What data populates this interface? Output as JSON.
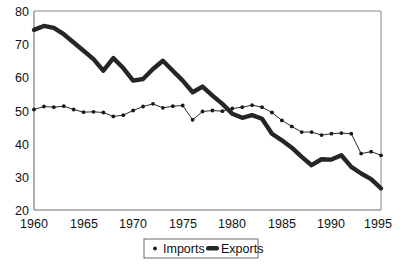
{
  "chart_data": {
    "type": "line",
    "title": "",
    "subtitle": "",
    "xlabel": "",
    "ylabel": "",
    "xlim": [
      1960,
      1995
    ],
    "ylim": [
      20,
      80
    ],
    "grid": false,
    "legend_position": "bottom-center",
    "x": [
      1960,
      1961,
      1962,
      1963,
      1964,
      1965,
      1966,
      1967,
      1968,
      1969,
      1970,
      1971,
      1972,
      1973,
      1974,
      1975,
      1976,
      1977,
      1978,
      1979,
      1980,
      1981,
      1982,
      1983,
      1984,
      1985,
      1986,
      1987,
      1988,
      1989,
      1990,
      1991,
      1992,
      1993,
      1994,
      1995
    ],
    "xticks": [
      1960,
      1965,
      1970,
      1975,
      1980,
      1985,
      1990,
      1995
    ],
    "xtick_labels": [
      "1960",
      "1965",
      "1970",
      "1975",
      "1980",
      "1985",
      "1990",
      "1995"
    ],
    "yticks": [
      20,
      30,
      40,
      50,
      60,
      70,
      80
    ],
    "ytick_labels": [
      "20",
      "30",
      "40",
      "50",
      "60",
      "70",
      "80"
    ],
    "series": [
      {
        "name": "Imports",
        "marker": "dot",
        "line_width": "thin",
        "values": [
          50.3,
          51.2,
          51.0,
          51.3,
          50.3,
          49.5,
          49.6,
          49.4,
          48.2,
          48.6,
          50.0,
          51.2,
          52.0,
          50.8,
          51.3,
          51.5,
          47.2,
          49.7,
          50.0,
          49.8,
          50.6,
          51.0,
          51.6,
          51.0,
          49.4,
          47.0,
          45.2,
          43.5,
          43.5,
          42.6,
          43.0,
          43.2,
          42.0,
          43.3,
          42.6,
          42.0
        ]
      },
      {
        "name": "Exports",
        "marker": "none",
        "line_width": "thick",
        "values": [
          74.3,
          75.5,
          74.9,
          73.0,
          70.5,
          68.0,
          65.5,
          62.0,
          65.8,
          62.8,
          59.0,
          59.5,
          62.5,
          65.0,
          62.0,
          59.0,
          55.5,
          57.2,
          54.5,
          52.0,
          49.0,
          47.8,
          48.6,
          47.5,
          43.0,
          41.0,
          38.8,
          36.0,
          33.5,
          35.3,
          35.2,
          36.5,
          34.7,
          34.8,
          33.0,
          31.5
        ]
      }
    ],
    "imports_tail": [
      43.0,
      37.0,
      37.6,
      36.5
    ],
    "exports_tail": [
      33.0,
      31.0,
      29.3,
      26.5
    ],
    "legend": [
      {
        "label": "Imports",
        "marker": "dot"
      },
      {
        "label": "Exports",
        "marker": "thick-line"
      }
    ]
  },
  "colors": {
    "series_line": "#262626",
    "axis": "#6f6f6f",
    "frame": "#8a8a8a",
    "background": "#ffffff",
    "text": "#111111"
  }
}
